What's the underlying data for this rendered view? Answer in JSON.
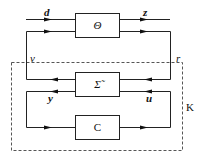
{
  "diagram": {
    "blocks": [
      {
        "id": "theta",
        "label": "Θ"
      },
      {
        "id": "sigma",
        "label": "Σ̃"
      },
      {
        "id": "controller",
        "label": "C"
      }
    ],
    "signals": {
      "d": "d",
      "z": "z",
      "v": "v",
      "r": "r",
      "y": "y",
      "u": "u"
    },
    "region_label": "K",
    "colors": {
      "line": "#222222",
      "dashed": "#555555",
      "background": "#ffffff"
    }
  }
}
